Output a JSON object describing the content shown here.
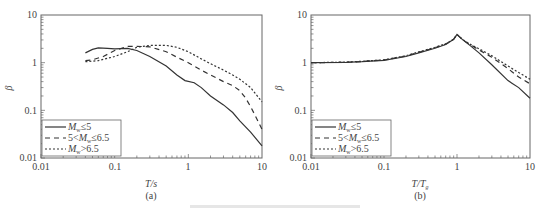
{
  "chart_data": [
    {
      "type": "line",
      "panel_label": "(a)",
      "xscale": "log",
      "yscale": "log",
      "xlabel": "T/s",
      "ylabel": "β",
      "xlim": [
        0.01,
        10
      ],
      "ylim": [
        0.01,
        10
      ],
      "xticks": [
        "0.01",
        "0.1",
        "1",
        "10"
      ],
      "yticks": [
        "0.01",
        "0.1",
        "1",
        "10"
      ],
      "grid": false,
      "legend_position": "lower left",
      "series": [
        {
          "name": "Mw≤5",
          "style": "solid",
          "x": [
            0.04,
            0.05,
            0.06,
            0.08,
            0.1,
            0.15,
            0.2,
            0.3,
            0.5,
            0.7,
            0.9,
            1.2,
            1.5,
            2,
            3,
            4,
            5,
            7,
            10
          ],
          "y": [
            1.6,
            1.9,
            2.05,
            2.0,
            1.95,
            2.0,
            1.8,
            1.35,
            0.85,
            0.55,
            0.42,
            0.38,
            0.3,
            0.2,
            0.13,
            0.09,
            0.06,
            0.035,
            0.018
          ]
        },
        {
          "name": "5<Mw≤6.5",
          "style": "dashed",
          "x": [
            0.04,
            0.05,
            0.07,
            0.1,
            0.15,
            0.2,
            0.3,
            0.5,
            0.7,
            1,
            1.5,
            2,
            3,
            4,
            5,
            6,
            7,
            8,
            10
          ],
          "y": [
            1.1,
            1.15,
            1.35,
            1.8,
            2.2,
            2.2,
            2.15,
            1.7,
            1.3,
            1.0,
            0.7,
            0.55,
            0.4,
            0.33,
            0.26,
            0.18,
            0.12,
            0.08,
            0.04
          ]
        },
        {
          "name": "Mw>6.5",
          "style": "dotted",
          "x": [
            0.04,
            0.06,
            0.1,
            0.15,
            0.2,
            0.3,
            0.5,
            0.7,
            1,
            1.5,
            2,
            3,
            4,
            5,
            7,
            10
          ],
          "y": [
            1.05,
            1.1,
            1.35,
            1.7,
            2.1,
            2.3,
            2.3,
            2.1,
            1.7,
            1.2,
            0.95,
            0.7,
            0.55,
            0.45,
            0.3,
            0.15
          ]
        }
      ]
    },
    {
      "type": "line",
      "panel_label": "(b)",
      "xscale": "log",
      "yscale": "log",
      "xlabel": "T/Tg",
      "ylabel": "β",
      "xlim": [
        0.01,
        10
      ],
      "ylim": [
        0.01,
        10
      ],
      "xticks": [
        "0.01",
        "0.1",
        "1",
        "10"
      ],
      "yticks": [
        "0.01",
        "0.1",
        "1",
        "10"
      ],
      "grid": false,
      "legend_position": "lower left",
      "series": [
        {
          "name": "Mw≤5",
          "style": "solid",
          "x": [
            0.01,
            0.03,
            0.05,
            0.1,
            0.2,
            0.3,
            0.5,
            0.7,
            0.9,
            1.0,
            1.2,
            1.5,
            2,
            3,
            5,
            7,
            10
          ],
          "y": [
            1.0,
            1.02,
            1.05,
            1.12,
            1.35,
            1.6,
            2.0,
            2.4,
            3.1,
            3.9,
            3.0,
            2.3,
            1.6,
            0.9,
            0.42,
            0.3,
            0.18
          ]
        },
        {
          "name": "5<Mw≤6.5",
          "style": "dashed",
          "x": [
            0.01,
            0.03,
            0.05,
            0.1,
            0.2,
            0.3,
            0.5,
            0.7,
            0.9,
            1.0,
            1.2,
            1.5,
            2,
            3,
            5,
            7,
            10
          ],
          "y": [
            1.0,
            1.02,
            1.06,
            1.14,
            1.38,
            1.65,
            2.05,
            2.45,
            3.1,
            3.9,
            3.0,
            2.4,
            1.85,
            1.3,
            0.75,
            0.5,
            0.36
          ]
        },
        {
          "name": "Mw>6.5",
          "style": "dotted",
          "x": [
            0.01,
            0.03,
            0.05,
            0.1,
            0.2,
            0.3,
            0.5,
            0.7,
            0.9,
            1.0,
            1.2,
            1.5,
            2,
            3,
            5,
            7,
            10
          ],
          "y": [
            1.0,
            1.03,
            1.07,
            1.15,
            1.4,
            1.68,
            2.1,
            2.5,
            3.1,
            3.9,
            3.05,
            2.45,
            1.95,
            1.4,
            0.85,
            0.62,
            0.45
          ]
        }
      ]
    }
  ],
  "panels": {
    "a": {
      "label": "(a)",
      "xlabel": "T/s",
      "ylabel": "β",
      "ticks": [
        "0.01",
        "0.1",
        "1",
        "10"
      ],
      "legend": [
        {
          "pre": "",
          "sym": "M",
          "sub": "w",
          "post": "≤5"
        },
        {
          "pre": "5<",
          "sym": "M",
          "sub": "w",
          "post": "≤6.5"
        },
        {
          "pre": "",
          "sym": "M",
          "sub": "w",
          "post": ">6.5"
        }
      ]
    },
    "b": {
      "label": "(b)",
      "xlabel": "T/T",
      "xlabel_sub": "g",
      "ylabel": "β",
      "ticks": [
        "0.01",
        "0.1",
        "1",
        "10"
      ],
      "legend": [
        {
          "pre": "",
          "sym": "M",
          "sub": "w",
          "post": "≤5"
        },
        {
          "pre": "5<",
          "sym": "M",
          "sub": "w",
          "post": "≤6.5"
        },
        {
          "pre": "",
          "sym": "M",
          "sub": "w",
          "post": ">6.5"
        }
      ]
    }
  },
  "colors": {
    "line": "#333333",
    "axis": "#555555"
  }
}
